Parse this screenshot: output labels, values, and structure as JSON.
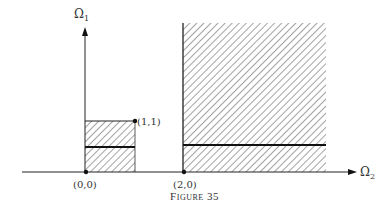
{
  "figure": {
    "caption": "Figure 35",
    "axes": {
      "vertical_label": "Ω",
      "vertical_label_sub": "1",
      "horizontal_label": "Ω",
      "horizontal_label_sub": "2"
    },
    "points": [
      {
        "label": "(0,0)"
      },
      {
        "label": "(1,1)"
      },
      {
        "label": "(2,0)"
      }
    ],
    "regions": [
      {
        "name": "small-box",
        "description": "hatched square from (0,0) to (1,1) with thick horizontal line at mid-height"
      },
      {
        "name": "large-region",
        "description": "hatched region starting at x=2 extending upward, with thick horizontal line at height 1/2"
      }
    ],
    "colors": {
      "ink": "#222222",
      "hatch": "#555555",
      "background": "#ffffff"
    }
  }
}
